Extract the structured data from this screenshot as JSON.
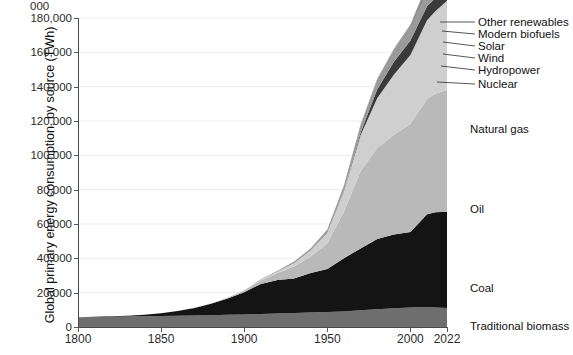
{
  "chart_data": {
    "type": "area",
    "stacked": true,
    "title": "",
    "xlabel": "",
    "ylabel": "Global primary energy consumption, by source (TWh)",
    "xlim": [
      1800,
      2022
    ],
    "ylim": [
      0,
      180000
    ],
    "ytick_labels": [
      "0",
      "20,000",
      "40,000",
      "60,000",
      "80,000",
      "100,000",
      "120,000",
      "140,000",
      "160,000",
      "180,000"
    ],
    "ytick_values": [
      0,
      20000,
      40000,
      60000,
      80000,
      100000,
      120000,
      140000,
      160000,
      180000
    ],
    "ytick_partial_top": "000",
    "xtick_labels": [
      "1800",
      "1850",
      "1900",
      "1950",
      "2000",
      "2022"
    ],
    "xtick_values": [
      1800,
      1850,
      1900,
      1950,
      2000,
      2022
    ],
    "grid": true,
    "legend_position": "inline-right",
    "x": [
      1800,
      1810,
      1820,
      1830,
      1840,
      1850,
      1860,
      1870,
      1880,
      1890,
      1900,
      1910,
      1920,
      1930,
      1940,
      1950,
      1960,
      1970,
      1980,
      1990,
      2000,
      2010,
      2015,
      2022
    ],
    "series": [
      {
        "name": "Traditional biomass",
        "color": "#6e6e6e",
        "values": [
          5620,
          5750,
          5900,
          6050,
          6200,
          6350,
          6500,
          6700,
          6900,
          7100,
          7300,
          7600,
          7900,
          8200,
          8500,
          8800,
          9100,
          9700,
          10300,
          10900,
          11400,
          11700,
          11400,
          11100
        ]
      },
      {
        "name": "Coal",
        "color": "#141414",
        "values": [
          100,
          180,
          300,
          520,
          900,
          1600,
          2800,
          4400,
          6700,
          9500,
          13000,
          17500,
          19500,
          20000,
          23000,
          25000,
          31000,
          36000,
          41000,
          43000,
          44000,
          54000,
          55500,
          56000
        ]
      },
      {
        "name": "Oil",
        "color": "#b9b9b9",
        "values": [
          0,
          0,
          0,
          0,
          0,
          0,
          0,
          50,
          150,
          400,
          900,
          2000,
          4000,
          7000,
          9500,
          15000,
          27000,
          45000,
          53000,
          58000,
          63000,
          67000,
          69000,
          71000
        ]
      },
      {
        "name": "Natural gas",
        "color": "#cfcfcf",
        "values": [
          0,
          0,
          0,
          0,
          0,
          0,
          0,
          0,
          0,
          50,
          150,
          400,
          900,
          2000,
          3500,
          6000,
          12000,
          21000,
          29000,
          35000,
          40000,
          46000,
          48000,
          52000
        ]
      },
      {
        "name": "Nuclear",
        "color": "#3a3a3a",
        "values": [
          0,
          0,
          0,
          0,
          0,
          0,
          0,
          0,
          0,
          0,
          0,
          0,
          0,
          0,
          0,
          0,
          300,
          1500,
          5000,
          7500,
          8500,
          8200,
          7700,
          7800
        ]
      },
      {
        "name": "Hydropower",
        "color": "#9a9a9a",
        "values": [
          0,
          0,
          0,
          0,
          0,
          0,
          0,
          0,
          0,
          30,
          80,
          250,
          500,
          900,
          1300,
          2000,
          3000,
          4500,
          5800,
          6800,
          7900,
          9200,
          10000,
          11300
        ]
      },
      {
        "name": "Wind",
        "color": "#2e2e2e",
        "values": [
          0,
          0,
          0,
          0,
          0,
          0,
          0,
          0,
          0,
          0,
          0,
          0,
          0,
          0,
          0,
          0,
          0,
          0,
          0,
          10,
          80,
          900,
          2200,
          6400
        ]
      },
      {
        "name": "Solar",
        "color": "#c4c4c4",
        "values": [
          0,
          0,
          0,
          0,
          0,
          0,
          0,
          0,
          0,
          0,
          0,
          0,
          0,
          0,
          0,
          0,
          0,
          0,
          0,
          0,
          5,
          100,
          700,
          3600
        ]
      },
      {
        "name": "Modern biofuels",
        "color": "#555555",
        "values": [
          0,
          0,
          0,
          0,
          0,
          0,
          0,
          0,
          0,
          0,
          0,
          0,
          0,
          0,
          0,
          0,
          0,
          0,
          50,
          150,
          400,
          1000,
          1300,
          1700
        ]
      },
      {
        "name": "Other renewables",
        "color": "#8f8f8f",
        "values": [
          0,
          0,
          0,
          0,
          0,
          0,
          0,
          0,
          0,
          0,
          0,
          0,
          0,
          0,
          20,
          50,
          100,
          200,
          400,
          600,
          900,
          1700,
          2300,
          3500
        ]
      }
    ],
    "inline_labels": [
      {
        "text": "Natural gas",
        "x": 470,
        "y": 123
      },
      {
        "text": "Oil",
        "x": 470,
        "y": 203
      },
      {
        "text": "Coal",
        "x": 470,
        "y": 282
      },
      {
        "text": "Traditional biomass",
        "x": 470,
        "y": 320
      }
    ],
    "leader_labels": [
      {
        "text": "Other renewables",
        "x": 478,
        "y": 16
      },
      {
        "text": "Modern biofuels",
        "x": 478,
        "y": 28
      },
      {
        "text": "Solar",
        "x": 478,
        "y": 40
      },
      {
        "text": "Wind",
        "x": 478,
        "y": 52
      },
      {
        "text": "Hydropower",
        "x": 478,
        "y": 64
      },
      {
        "text": "Nuclear",
        "x": 478,
        "y": 78
      }
    ]
  }
}
